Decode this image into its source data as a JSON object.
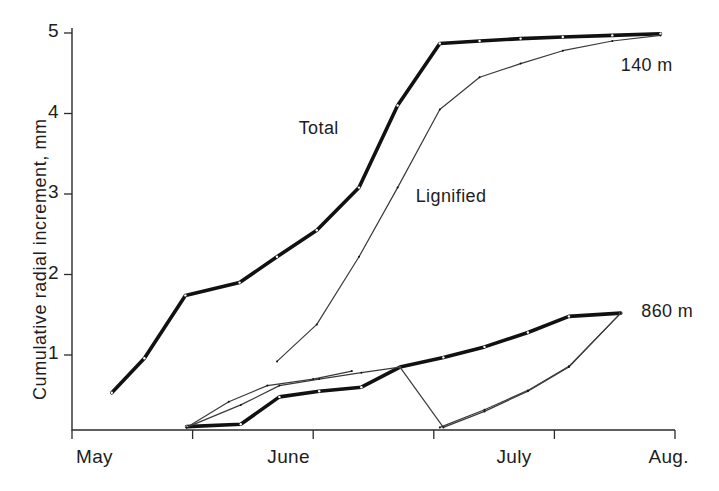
{
  "chart_data": {
    "type": "line",
    "title": "",
    "xlabel": "",
    "ylabel": "Cumulative radial  increment, mm",
    "ylim": [
      0,
      5.3
    ],
    "yticks": [
      1,
      2,
      3,
      4,
      5
    ],
    "ytick_labels": [
      "1",
      "2",
      "3",
      "4",
      "5"
    ],
    "xlim": [
      0,
      5
    ],
    "xticks": [
      0,
      1,
      2,
      3,
      4,
      5
    ],
    "xtick_labels": [
      "May",
      "",
      "June",
      "",
      "July",
      "Aug."
    ],
    "x_axis_months": [
      "May",
      "June",
      "July",
      "Aug."
    ],
    "grid": false,
    "legend_position": "inline-annotations",
    "annotations": [
      {
        "text": "Total",
        "x": 2.05,
        "y": 3.72
      },
      {
        "text": "Lignified",
        "x": 3.05,
        "y": 2.85
      },
      {
        "text": "140 m",
        "x": 4.55,
        "y": 4.58
      },
      {
        "text": "860 m",
        "x": 4.62,
        "y": 1.52
      }
    ],
    "series": [
      {
        "name": "Total 140 m",
        "site": "140 m",
        "measure": "Total",
        "style": "thick",
        "x": [
          0.33,
          0.6,
          0.94,
          1.39,
          1.7,
          2.03,
          2.38,
          2.7,
          3.05,
          3.38,
          3.72,
          4.07,
          4.48,
          4.88
        ],
        "y": [
          0.53,
          0.96,
          1.74,
          1.9,
          2.22,
          2.55,
          3.08,
          4.1,
          4.87,
          4.9,
          4.93,
          4.95,
          4.97,
          4.99
        ]
      },
      {
        "name": "Lignified 140 m",
        "site": "140 m",
        "measure": "Lignified",
        "style": "thin",
        "x": [
          1.7,
          2.03,
          2.38,
          2.7,
          3.05,
          3.38,
          3.72,
          4.07,
          4.48,
          4.88
        ],
        "y": [
          0.92,
          1.38,
          2.22,
          3.08,
          4.05,
          4.45,
          4.62,
          4.78,
          4.9,
          4.97
        ]
      },
      {
        "name": "Total 860 m",
        "site": "860 m",
        "measure": "Total",
        "style": "thick",
        "x": [
          0.95,
          1.4,
          1.72,
          2.05,
          2.4,
          2.72,
          3.08,
          3.42,
          3.78,
          4.12,
          4.55
        ],
        "y": [
          0.11,
          0.14,
          0.48,
          0.55,
          0.6,
          0.85,
          0.97,
          1.1,
          1.28,
          1.48,
          1.52
        ]
      },
      {
        "name": "Lignified 860 m",
        "site": "860 m",
        "measure": "Lignified",
        "style": "thin",
        "x": [
          0.95,
          1.4,
          1.72,
          2.05,
          2.4,
          2.72,
          3.08,
          3.42,
          3.78,
          4.12,
          4.55
        ],
        "y": [
          0.1,
          0.38,
          0.62,
          0.7,
          0.78,
          0.85,
          0.1,
          0.3,
          0.55,
          0.85,
          1.52
        ]
      },
      {
        "name": "Lignified 860 m segment",
        "site": "860 m",
        "measure": "Lignified",
        "style": "thin",
        "x": [
          0.95,
          1.3,
          1.62,
          2.0,
          2.32
        ],
        "y": [
          0.1,
          0.42,
          0.62,
          0.7,
          0.8
        ]
      },
      {
        "name": "Lignified 860 m later segment",
        "site": "860 m",
        "measure": "Lignified",
        "style": "thin",
        "x": [
          3.05,
          3.42,
          3.78,
          4.12,
          4.55
        ],
        "y": [
          0.1,
          0.32,
          0.56,
          0.86,
          1.52
        ]
      }
    ]
  },
  "axis": {
    "ytick_1": "1",
    "ytick_2": "2",
    "ytick_3": "3",
    "ytick_4": "4",
    "ytick_5": "5",
    "xtick_may": "May",
    "xtick_june": "June",
    "xtick_july": "July",
    "xtick_aug": "Aug.",
    "y_axis_title": "Cumulative radial  increment, mm"
  },
  "labels": {
    "total": "Total",
    "lignified": "Lignified",
    "site_140": "140 m",
    "site_860": "860 m"
  }
}
